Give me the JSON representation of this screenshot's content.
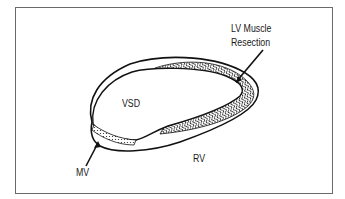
{
  "diagram": {
    "labels": {
      "lv_muscle_resection": [
        "LV Muscle",
        "Resection"
      ],
      "vsd": "VSD",
      "rv": "RV",
      "mv": "MV"
    },
    "colors": {
      "outline": "#111111",
      "frame": "#6a6a6a",
      "background": "#ffffff"
    }
  }
}
